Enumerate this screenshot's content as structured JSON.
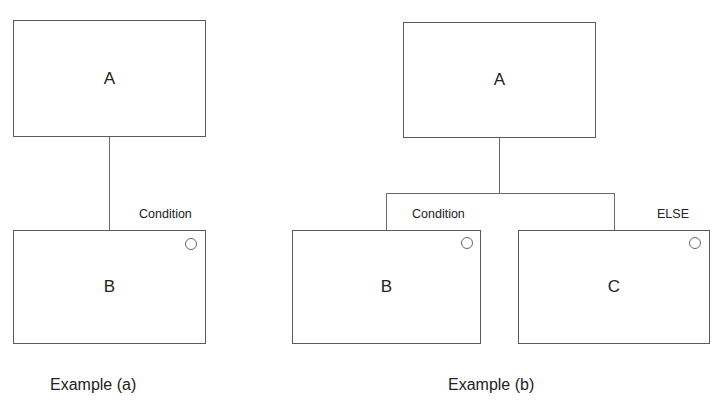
{
  "diagram": {
    "example_a": {
      "caption": "Example (a)",
      "parent": {
        "label": "A"
      },
      "child": {
        "label": "B",
        "condition": "Condition"
      }
    },
    "example_b": {
      "caption": "Example (b)",
      "parent": {
        "label": "A"
      },
      "children": [
        {
          "label": "B",
          "condition": "Condition"
        },
        {
          "label": "C",
          "condition": "ELSE"
        }
      ]
    }
  },
  "colors": {
    "line": "#5a5a5a",
    "text": "#222222",
    "background": "#ffffff"
  }
}
